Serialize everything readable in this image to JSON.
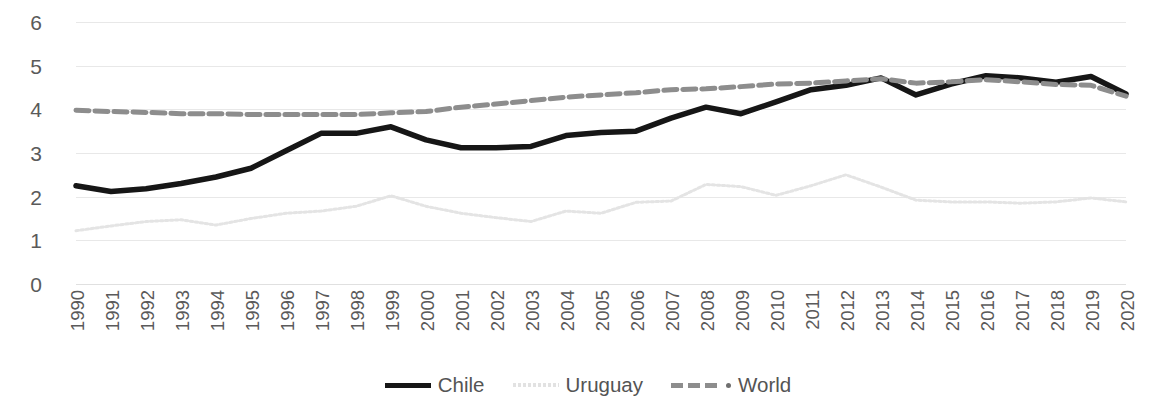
{
  "chart_data": {
    "type": "line",
    "title": "",
    "subtitle": "",
    "xlabel": "",
    "ylabel": "",
    "grid": true,
    "legend_position": "bottom",
    "ylim": [
      0,
      6
    ],
    "yticks": [
      0,
      1,
      2,
      3,
      4,
      5,
      6
    ],
    "ytick_labels": [
      "0",
      "1",
      "2",
      "3",
      "4",
      "5",
      "6"
    ],
    "categories": [
      "1990",
      "1991",
      "1992",
      "1993",
      "1994",
      "1995",
      "1996",
      "1997",
      "1998",
      "1999",
      "2000",
      "2001",
      "2002",
      "2003",
      "2004",
      "2005",
      "2006",
      "2007",
      "2008",
      "2009",
      "2010",
      "2011",
      "2012",
      "2013",
      "2014",
      "2015",
      "2016",
      "2017",
      "2018",
      "2019",
      "2020"
    ],
    "series": [
      {
        "name": "Chile",
        "color": "#161616",
        "style": "solid",
        "values": [
          2.25,
          2.12,
          2.18,
          2.3,
          2.45,
          2.65,
          3.05,
          3.45,
          3.45,
          3.6,
          3.3,
          3.12,
          3.12,
          3.15,
          3.4,
          3.47,
          3.5,
          3.8,
          4.05,
          3.9,
          4.17,
          4.45,
          4.55,
          4.72,
          4.33,
          4.58,
          4.77,
          4.72,
          4.62,
          4.75,
          4.35
        ]
      },
      {
        "name": "Uruguay",
        "color": "#e4e4e4",
        "style": "dotted",
        "values": [
          1.22,
          1.33,
          1.43,
          1.47,
          1.35,
          1.5,
          1.62,
          1.67,
          1.78,
          2.02,
          1.78,
          1.62,
          1.52,
          1.43,
          1.67,
          1.62,
          1.87,
          1.9,
          2.28,
          2.23,
          2.03,
          2.25,
          2.5,
          2.22,
          1.92,
          1.88,
          1.88,
          1.85,
          1.88,
          1.97,
          1.88
        ]
      },
      {
        "name": "World",
        "color": "#8d8d8d",
        "style": "dashed",
        "values": [
          3.98,
          3.95,
          3.93,
          3.9,
          3.9,
          3.88,
          3.88,
          3.88,
          3.88,
          3.92,
          3.95,
          4.05,
          4.12,
          4.2,
          4.28,
          4.33,
          4.38,
          4.45,
          4.47,
          4.52,
          4.58,
          4.6,
          4.65,
          4.7,
          4.6,
          4.63,
          4.68,
          4.63,
          4.57,
          4.55,
          4.3
        ]
      }
    ]
  },
  "legend": {
    "items": [
      {
        "label": "Chile",
        "style": "solid",
        "has_marker": false
      },
      {
        "label": "Uruguay",
        "style": "dotted",
        "has_marker": false
      },
      {
        "label": "World",
        "style": "dashed",
        "has_marker": true
      }
    ]
  }
}
